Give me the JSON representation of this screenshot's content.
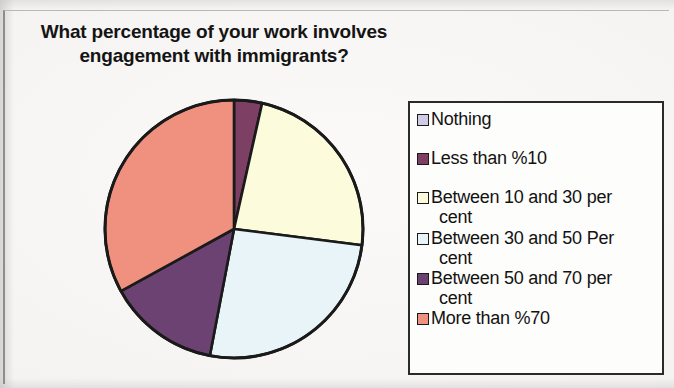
{
  "chart_data": {
    "type": "pie",
    "title": "What percentage of your work involves\nengagement with immigrants?",
    "xlabel": "",
    "ylabel": "",
    "legend_position": "right",
    "grid": false,
    "categories": [
      "Nothing",
      "Less than %10",
      "Between 10 and 30 per cent",
      "Between 30 and 50 Per cent",
      "Between 50 and 70 per cent",
      "More than %70"
    ],
    "values": [
      0,
      3.5,
      23.5,
      26,
      14,
      33
    ],
    "start_angle_deg": 0,
    "direction": "clockwise",
    "colors": [
      "#cfcce8",
      "#7d3f63",
      "#fcfbdc",
      "#e8f4f8",
      "#6b4272",
      "#f0907e"
    ],
    "slice_edge_color": "#1a1a1a",
    "series": [
      {
        "name": "What percentage of your work involves engagement with immigrants?",
        "values": [
          0,
          3.5,
          23.5,
          26,
          14,
          33
        ]
      }
    ]
  },
  "legend": {
    "items": [
      {
        "label": "Nothing",
        "color": "#cfcce8",
        "value": 0
      },
      {
        "label": "Less than %10",
        "color": "#7d3f63",
        "value": 3.5
      },
      {
        "label_line1": "Between 10 and 30 per",
        "label_line2": "cent",
        "color": "#fcfbdc",
        "value": 23.5
      },
      {
        "label_line1": "Between 30 and 50 Per",
        "label_line2": "cent",
        "color": "#e8f4f8",
        "value": 26
      },
      {
        "label_line1": "Between 50 and 70 per",
        "label_line2": "cent",
        "color": "#6b4272",
        "value": 14
      },
      {
        "label": "More than %70",
        "color": "#f0907e",
        "value": 33
      }
    ]
  }
}
